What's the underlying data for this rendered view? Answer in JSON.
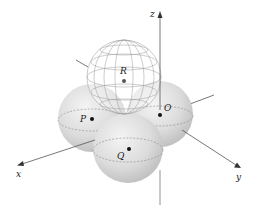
{
  "figure": {
    "type": "3d-sphere-arrangement",
    "axes": {
      "x": {
        "label": "x"
      },
      "y": {
        "label": "y"
      },
      "z": {
        "label": "z"
      }
    },
    "spheres": [
      {
        "id": "P",
        "label": "P",
        "style": "solid-shaded"
      },
      {
        "id": "O",
        "label": "O",
        "style": "solid-shaded"
      },
      {
        "id": "Q",
        "label": "Q",
        "style": "solid-shaded"
      },
      {
        "id": "R",
        "label": "R",
        "style": "wireframe"
      }
    ],
    "colors": {
      "sphere_fill": "#d9d9d9",
      "sphere_highlight": "#f2f2f2",
      "wireframe": "#9a9a9a",
      "axis": "#555555",
      "point": "#111111"
    }
  }
}
